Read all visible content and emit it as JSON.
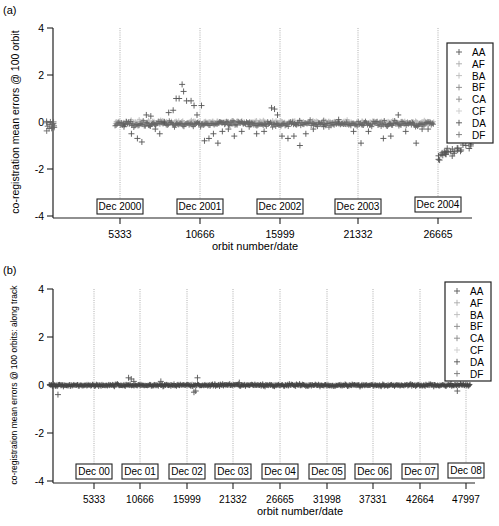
{
  "chart_data": [
    {
      "panel_label": "(a)",
      "type": "scatter",
      "xlabel": "orbit number/date",
      "ylabel": "co-registration mean errors @ 100 orbit",
      "ylim": [
        -4,
        4
      ],
      "yticks": [
        4,
        2,
        0,
        -2,
        -4
      ],
      "xticks": [
        5333,
        10666,
        15999,
        21332,
        26665
      ],
      "xlim": [
        0,
        30400
      ],
      "grid": "vertical dotted lines at each x tick",
      "legend": {
        "position": "upper right",
        "entries": [
          "AA",
          "AF",
          "BA",
          "BF",
          "CA",
          "CF",
          "DA",
          "DF"
        ]
      },
      "date_annotations": [
        {
          "label": "Dec 2000",
          "x": 5333
        },
        {
          "label": "Dec 2001",
          "x": 10666
        },
        {
          "label": "Dec 2002",
          "x": 15999
        },
        {
          "label": "Dec 2003",
          "x": 21332
        },
        {
          "label": "Dec 2004",
          "x": 26665
        }
      ],
      "data_summary": {
        "description": "Cluster of points around 0 near orbit ~500-1000; gap until ~5000; values mostly within -1..+0.3 with excursions up to ~1.6 around orbits 9000-10500; broad band near 0 from ~10700-26000 with scattered points down to -1; drop to about -1.5..-0.8 after orbit ~26700.",
        "series": [
          {
            "name": "AA",
            "x": [
              500,
              700,
              900,
              5000,
              5600,
              6400,
              7200,
              8000,
              8800,
              9200,
              9600,
              10000,
              10400,
              11000,
              12000,
              13000,
              14000,
              15000,
              15800,
              16500,
              17500,
              18500,
              19500,
              20500,
              21500,
              22500,
              23500,
              24500,
              25500,
              26800,
              27400,
              28000
            ],
            "y": [
              0.0,
              -0.4,
              -0.2,
              -0.1,
              -0.2,
              -0.8,
              0.3,
              -0.2,
              0.5,
              1.0,
              1.6,
              0.9,
              0.3,
              -0.7,
              -0.3,
              -0.2,
              -0.1,
              -0.5,
              0.6,
              -0.2,
              -0.6,
              -0.1,
              -0.4,
              0.0,
              -0.2,
              0.2,
              -0.3,
              -0.6,
              -0.3,
              -1.4,
              -1.1,
              -0.9
            ]
          }
        ]
      }
    },
    {
      "panel_label": "(b)",
      "type": "scatter",
      "xlabel": "orbit number/date",
      "ylabel": "co-registration mean errors @ 100 orbits: along track",
      "ylim": [
        -4,
        4
      ],
      "yticks": [
        4,
        2,
        0,
        -2,
        -4
      ],
      "xticks": [
        5333,
        10666,
        15999,
        21332,
        26665,
        31998,
        37331,
        42664,
        47997
      ],
      "xlim": [
        0,
        50000
      ],
      "grid": "vertical dotted lines at each x tick",
      "legend": {
        "position": "upper right",
        "entries": [
          "AA",
          "AF",
          "BA",
          "BF",
          "CA",
          "CF",
          "DA",
          "DF"
        ]
      },
      "date_annotations": [
        {
          "label": "Dec 00",
          "x": 5333
        },
        {
          "label": "Dec 01",
          "x": 10666
        },
        {
          "label": "Dec 02",
          "x": 15999
        },
        {
          "label": "Dec 03",
          "x": 21332
        },
        {
          "label": "Dec 04",
          "x": 26665
        },
        {
          "label": "Dec 05",
          "x": 31998
        },
        {
          "label": "Dec 06",
          "x": 37331
        },
        {
          "label": "Dec 07",
          "x": 42664
        },
        {
          "label": "Dec 08",
          "x": 47997
        }
      ],
      "data_summary": {
        "description": "Dense band tightly around 0 (approx -0.15..+0.15) from orbit ~200 to ~48500, with a few outliers: ~+0.3 near orbit 9500, ~+0.3 and -0.3 near 17000, ~-0.4 near 1200, ~-0.3 near 47000.",
        "series": [
          {
            "name": "all",
            "x": [
              200,
              1200,
              5333,
              9500,
              10666,
              15999,
              17000,
              17200,
              21332,
              26665,
              31998,
              37331,
              42664,
              47000,
              48500
            ],
            "y": [
              0.0,
              -0.4,
              0.0,
              0.3,
              0.05,
              0.0,
              0.3,
              -0.3,
              0.0,
              0.0,
              0.0,
              0.0,
              0.0,
              -0.3,
              -0.05
            ]
          }
        ]
      }
    }
  ],
  "panels": {
    "a": {
      "label": "(a)",
      "ylabel": "co-registration mean errors @ 100 orbit",
      "xlabel": "orbit number/date",
      "yticks": [
        "4",
        "2",
        "0",
        "-2",
        "-4"
      ],
      "xticks": [
        "5333",
        "10666",
        "15999",
        "21332",
        "26665"
      ],
      "dates": [
        "Dec 2000",
        "Dec 2001",
        "Dec 2002",
        "Dec 2003",
        "Dec 2004"
      ],
      "legend": [
        "AA",
        "AF",
        "BA",
        "BF",
        "CA",
        "CF",
        "DA",
        "DF"
      ]
    },
    "b": {
      "label": "(b)",
      "ylabel": "co-registration mean errors @ 100 orbits: along track",
      "xlabel": "orbit number/date",
      "yticks": [
        "4",
        "2",
        "0",
        "-2",
        "-4"
      ],
      "xticks": [
        "5333",
        "10666",
        "15999",
        "21332",
        "26665",
        "31998",
        "37331",
        "42664",
        "47997"
      ],
      "dates": [
        "Dec 00",
        "Dec 01",
        "Dec 02",
        "Dec 03",
        "Dec 04",
        "Dec 05",
        "Dec 06",
        "Dec 07",
        "Dec 08"
      ],
      "legend": [
        "AA",
        "AF",
        "BA",
        "BF",
        "CA",
        "CF",
        "DA",
        "DF"
      ]
    }
  },
  "colors": {
    "axis": "#222222",
    "marker_dark": "#555555",
    "marker_light": "#aaaaaa",
    "gridline": "#999999"
  }
}
